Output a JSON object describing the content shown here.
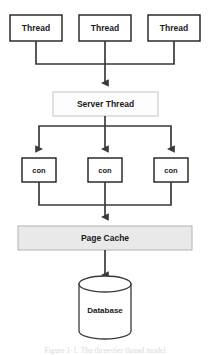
{
  "figure": {
    "type": "flow-diagram",
    "background_color": "#ffffff",
    "line_color": "#3a3a3a",
    "caption": "Figure 1-1. The three-tier thread model"
  },
  "nodes": {
    "client_threads": [
      {
        "label": "Thread",
        "x": 10,
        "y": 15,
        "w": 52,
        "h": 26
      },
      {
        "label": "Thread",
        "x": 79,
        "y": 15,
        "w": 52,
        "h": 26
      },
      {
        "label": "Thread",
        "x": 148,
        "y": 15,
        "w": 52,
        "h": 26
      }
    ],
    "server_thread": {
      "label": "Server Thread",
      "x": 53,
      "y": 92,
      "w": 105,
      "h": 24,
      "fill": "#fdfdfd",
      "border": "#c9c9c9"
    },
    "connections": [
      {
        "label": "con",
        "x": 22,
        "y": 158,
        "w": 34,
        "h": 24
      },
      {
        "label": "con",
        "x": 88,
        "y": 158,
        "w": 34,
        "h": 24
      },
      {
        "label": "con",
        "x": 154,
        "y": 158,
        "w": 34,
        "h": 24
      }
    ],
    "page_cache": {
      "label": "Page Cache",
      "x": 18,
      "y": 226,
      "w": 174,
      "h": 24,
      "fill": "#e9e9e9",
      "border": "#b9b9b9"
    },
    "database": {
      "label": "Database",
      "cx": 105,
      "top_y": 284,
      "rx": 26,
      "ry": 8,
      "body_h": 47,
      "fill": "#ffffff",
      "border": "#3a3a3a"
    }
  },
  "edges": [
    {
      "from": "client-threads",
      "to": "server-thread",
      "kind": "merge-bus"
    },
    {
      "from": "server-thread",
      "to": "connections",
      "kind": "fan-out-bus"
    },
    {
      "from": "connections",
      "to": "page-cache",
      "kind": "merge-bus"
    },
    {
      "from": "page-cache",
      "to": "database",
      "kind": "straight"
    }
  ]
}
